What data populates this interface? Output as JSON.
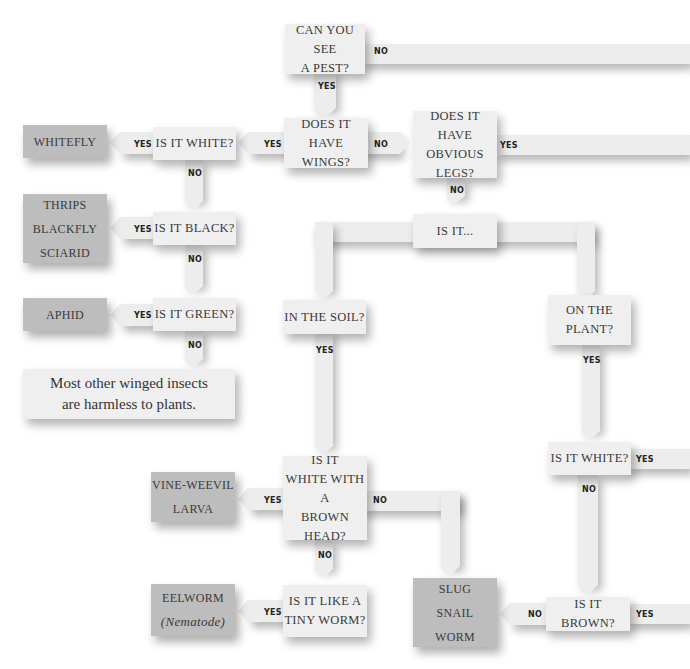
{
  "flowchart": {
    "title_question": "Can you see a pest?",
    "questions": {
      "see_pest": [
        "CAN YOU SEE",
        "A PEST?"
      ],
      "wings": [
        "DOES IT",
        "HAVE WINGS?"
      ],
      "legs": [
        "DOES IT HAVE",
        "OBVIOUS LEGS?"
      ],
      "is_white_winged": "IS IT WHITE?",
      "is_black": "IS IT BLACK?",
      "is_green": "IS IT GREEN?",
      "is_it": "IS IT...",
      "in_soil": "IN THE SOIL?",
      "on_plant": [
        "ON THE",
        "PLANT?"
      ],
      "white_brown_head": [
        "IS IT",
        "WHITE WITH A",
        "BROWN HEAD?"
      ],
      "tiny_worm": [
        "IS IT LIKE A",
        "TINY WORM?"
      ],
      "is_white_plant": "IS IT WHITE?",
      "is_brown": "IS IT BROWN?"
    },
    "answers": {
      "whitefly": "WHITEFLY",
      "thrips_group": [
        "THRIPS",
        "BLACKFLY",
        "SCIARID"
      ],
      "aphid": "APHID",
      "vine_weevil": [
        "VINE-WEEVIL",
        "LARVA"
      ],
      "eelworm": [
        "EELWORM",
        "(Nematode)"
      ],
      "slug_group": [
        "SLUG",
        "SNAIL",
        "WORM"
      ]
    },
    "note": [
      "Most other winged insects",
      "are harmless to plants."
    ],
    "labels": {
      "yes": "YES",
      "no": "NO"
    }
  }
}
